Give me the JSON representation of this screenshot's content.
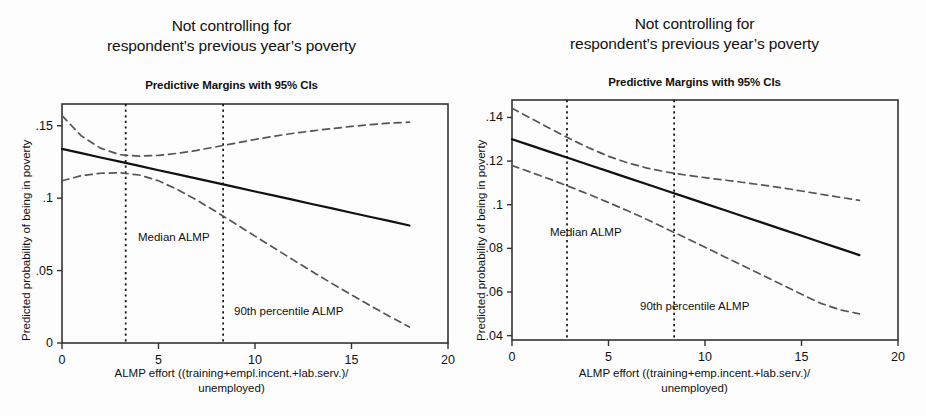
{
  "figure": {
    "width": 926,
    "height": 416,
    "background": "#fdfdfd",
    "panel_count": 2
  },
  "panels": [
    {
      "id": "left",
      "title_line1": "Not controlling for",
      "title_line2": "respondent’s previous year’s poverty",
      "subtitle": "Predictive Margins with 95% CIs",
      "ylabel": "Predicted probability of being in  poverty",
      "xlabel_line1": "ALMP effort ((training+empl.incent.+lab.serv.)/",
      "xlabel_line2": "unemployed)",
      "yticks": [
        "0",
        ".05",
        ".1",
        ".15"
      ],
      "xticks": [
        "0",
        "5",
        "10",
        "15",
        "20"
      ],
      "annotations": [
        "Median ALMP",
        "90th percentile ALMP"
      ]
    },
    {
      "id": "right",
      "title_line1": "Not controlling for",
      "title_line2": "respondent’s previous year’s poverty",
      "subtitle": "Predictive Margins with 95% CIs",
      "ylabel": "Predicted probability of being in  poverty",
      "xlabel_line1": "ALMP effort ((training+emp.incent.+lab.serv.)/",
      "xlabel_line2": "unemployed)",
      "yticks": [
        ".04",
        ".06",
        ".08",
        ".1",
        ".12",
        ".14"
      ],
      "xticks": [
        "0",
        "5",
        "10",
        "15",
        "20"
      ],
      "annotations": [
        "Median ALMP",
        "90th percentile ALMP"
      ]
    }
  ],
  "chart_data": [
    {
      "type": "line",
      "panel": "left",
      "title": "Not controlling for respondent’s previous year’s poverty",
      "subtitle": "Predictive Margins with 95% CIs",
      "xlabel": "ALMP effort ((training+empl.incent.+lab.serv.)/unemployed)",
      "ylabel": "Predicted probability of being in  poverty",
      "xlim": [
        0,
        20
      ],
      "ylim": [
        0,
        0.165
      ],
      "ytick_values": [
        0,
        0.05,
        0.1,
        0.15
      ],
      "ytick_labels": [
        "0",
        ".05",
        ".1",
        ".15"
      ],
      "xtick_values": [
        0,
        5,
        10,
        15,
        20
      ],
      "xtick_labels": [
        "0",
        "5",
        "10",
        "15",
        "20"
      ],
      "grid": false,
      "legend": "none",
      "x": [
        0,
        1,
        2,
        3,
        4,
        5,
        6,
        7,
        8,
        9,
        10,
        11,
        12,
        13,
        14,
        15,
        16,
        17,
        18
      ],
      "series": [
        {
          "name": "Predicted probability (margin)",
          "style": "solid",
          "color": "#111111",
          "values": [
            0.134,
            0.1311,
            0.1281,
            0.1252,
            0.1223,
            0.1193,
            0.1164,
            0.1135,
            0.1105,
            0.1076,
            0.1046,
            0.1017,
            0.0988,
            0.0958,
            0.0929,
            0.0899,
            0.087,
            0.0841,
            0.0811
          ]
        },
        {
          "name": "95% CI upper",
          "style": "dashed",
          "color": "#555555",
          "values": [
            0.157,
            0.143,
            0.1345,
            0.13,
            0.129,
            0.1295,
            0.131,
            0.133,
            0.1355,
            0.138,
            0.1405,
            0.1428,
            0.1448,
            0.1465,
            0.148,
            0.1495,
            0.1508,
            0.1518,
            0.1525
          ]
        },
        {
          "name": "95% CI lower",
          "style": "dashed",
          "color": "#555555",
          "values": [
            0.112,
            0.1155,
            0.1172,
            0.1175,
            0.116,
            0.112,
            0.1058,
            0.0985,
            0.0905,
            0.0822,
            0.0738,
            0.0655,
            0.0572,
            0.049,
            0.041,
            0.0332,
            0.0256,
            0.0182,
            0.011
          ]
        }
      ],
      "reference_lines": [
        {
          "label": "Median ALMP",
          "x": 3.3,
          "style": "dotted"
        },
        {
          "label": "90th percentile ALMP",
          "x": 8.35,
          "style": "dotted"
        }
      ]
    },
    {
      "type": "line",
      "panel": "right",
      "title": "Not controlling for respondent’s previous year’s poverty",
      "subtitle": "Predictive Margins with 95% CIs",
      "xlabel": "ALMP effort ((training+emp.incent.+lab.serv.)/unemployed)",
      "ylabel": "Predicted probability of being in  poverty",
      "xlim": [
        0,
        20
      ],
      "ylim": [
        0.038,
        0.148
      ],
      "ytick_values": [
        0.04,
        0.06,
        0.08,
        0.1,
        0.12,
        0.14
      ],
      "ytick_labels": [
        ".04",
        ".06",
        ".08",
        ".1",
        ".12",
        ".14"
      ],
      "xtick_values": [
        0,
        5,
        10,
        15,
        20
      ],
      "xtick_labels": [
        "0",
        "5",
        "10",
        "15",
        "20"
      ],
      "grid": false,
      "legend": "none",
      "x": [
        0,
        1,
        2,
        3,
        4,
        5,
        6,
        7,
        8,
        9,
        10,
        11,
        12,
        13,
        14,
        15,
        16,
        17,
        18
      ],
      "series": [
        {
          "name": "Predicted probability (margin)",
          "style": "solid",
          "color": "#111111",
          "values": [
            0.13,
            0.1271,
            0.1241,
            0.1212,
            0.1182,
            0.1153,
            0.1123,
            0.1094,
            0.1064,
            0.1035,
            0.1005,
            0.0976,
            0.0946,
            0.0917,
            0.0887,
            0.0858,
            0.0828,
            0.0799,
            0.0769
          ]
        },
        {
          "name": "95% CI upper",
          "style": "dashed",
          "color": "#555555",
          "values": [
            0.1442,
            0.1395,
            0.1348,
            0.1302,
            0.126,
            0.1222,
            0.1192,
            0.1168,
            0.115,
            0.1136,
            0.1124,
            0.1113,
            0.1102,
            0.109,
            0.1077,
            0.1063,
            0.1048,
            0.1034,
            0.102
          ]
        },
        {
          "name": "95% CI lower",
          "style": "dashed",
          "color": "#555555",
          "values": [
            0.118,
            0.1148,
            0.1116,
            0.1082,
            0.1047,
            0.101,
            0.0972,
            0.0932,
            0.089,
            0.0848,
            0.0805,
            0.0762,
            0.0719,
            0.0676,
            0.0633,
            0.059,
            0.0548,
            0.0518,
            0.05
          ]
        }
      ],
      "reference_lines": [
        {
          "label": "Median ALMP",
          "x": 2.85,
          "style": "dotted"
        },
        {
          "label": "90th percentile ALMP",
          "x": 8.4,
          "style": "dotted"
        }
      ]
    }
  ]
}
